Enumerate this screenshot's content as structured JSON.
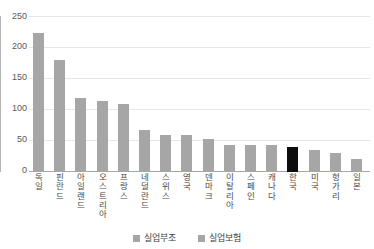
{
  "chart_data": {
    "type": "bar",
    "title": "",
    "xlabel": "",
    "ylabel": "",
    "ylim": [
      0,
      250
    ],
    "yticks": [
      0,
      50,
      100,
      150,
      200,
      250
    ],
    "grid": true,
    "legend_position": "bottom",
    "categories": [
      "독일",
      "핀란드",
      "아일랜드",
      "오스트리아",
      "프랑스",
      "네덜란드",
      "스위스",
      "영국",
      "덴마크",
      "이탈리아",
      "스페인",
      "캐나다",
      "한국",
      "미국",
      "헝가리",
      "일본"
    ],
    "values": [
      224,
      180,
      120,
      115,
      110,
      68,
      59,
      59,
      54,
      44,
      44,
      44,
      40,
      35,
      30,
      21
    ],
    "highlight_category": "한국",
    "highlight_color": "#0d0d0d",
    "bar_color": "#a6a6a6",
    "series": [
      {
        "name": "실업부조",
        "color": "#a6a6a6",
        "values": [
          224,
          180,
          120,
          115,
          110,
          68,
          59,
          59,
          54,
          44,
          44,
          44,
          40,
          35,
          30,
          21
        ]
      },
      {
        "name": "실업보험",
        "color": "#a6a6a6",
        "values": [
          0,
          0,
          0,
          0,
          0,
          0,
          0,
          0,
          0,
          0,
          0,
          0,
          0,
          0,
          0,
          0
        ]
      }
    ]
  },
  "title_remnant": "",
  "yaxis": {
    "ticks": [
      {
        "label": "250"
      },
      {
        "label": "200"
      },
      {
        "label": "150"
      },
      {
        "label": "100"
      },
      {
        "label": "50"
      },
      {
        "label": "0"
      }
    ]
  },
  "legend": {
    "items": [
      {
        "label": "실업부조",
        "color": "#a6a6a6"
      },
      {
        "label": "실업보험",
        "color": "#a6a6a6"
      }
    ]
  }
}
